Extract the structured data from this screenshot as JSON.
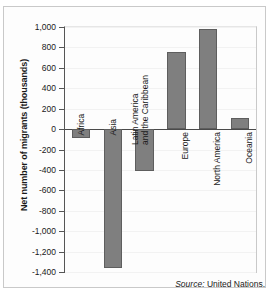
{
  "chart_data": {
    "type": "bar",
    "title": "",
    "xlabel": "",
    "ylabel": "Net number of migrants (thousands)",
    "categories": [
      "Africa",
      "Asia",
      "Latin America and the Caribbean",
      "Europe",
      "North America",
      "Oceania"
    ],
    "values": [
      -90,
      -1360,
      -415,
      755,
      985,
      105
    ],
    "ylim": [
      -1400,
      1000
    ],
    "ytick_labels": [
      "1,000",
      "800",
      "600",
      "400",
      "200",
      "0",
      "-200",
      "-400",
      "-600",
      "-800",
      "-1,000",
      "-1,200",
      "-1,400"
    ],
    "ytick_values": [
      1000,
      800,
      600,
      400,
      200,
      0,
      -200,
      -400,
      -600,
      -800,
      -1000,
      -1200,
      -1400
    ],
    "grid": false,
    "legend": "none",
    "bar_color": "#7f7f7f",
    "bar_border_color": "#5e5e5e",
    "axis_color": "#555555"
  },
  "source": {
    "prefix": "Source:",
    "text": "United Nations."
  }
}
